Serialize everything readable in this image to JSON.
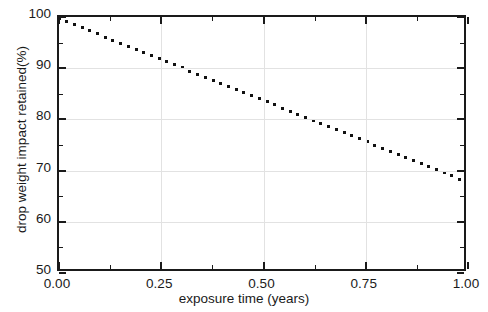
{
  "figure": {
    "title_fragment": "",
    "background_color": "#ffffff",
    "axis_color": "#1a1a1a",
    "grid_color": "#e2e2e2",
    "series_color": "#111111"
  },
  "axes": {
    "x": {
      "label": "exposure time (years)",
      "min": 0.0,
      "max": 1.0,
      "major_ticks": [
        0.0,
        0.25,
        0.5,
        0.75,
        1.0
      ],
      "major_tick_labels": [
        "0.00",
        "0.25",
        "0.50",
        "0.75",
        "1.00"
      ],
      "minor_ticks": [
        0.125,
        0.375,
        0.625,
        0.875
      ]
    },
    "y": {
      "label": "drop weight impact retained(%)",
      "min": 50,
      "max": 100,
      "major_ticks": [
        50,
        60,
        70,
        80,
        90,
        100
      ],
      "major_tick_labels": [
        "50",
        "60",
        "70",
        "80",
        "90",
        "100"
      ],
      "minor_ticks": [
        55,
        65,
        75,
        85,
        95
      ]
    }
  },
  "chart_data": {
    "type": "line",
    "title": "",
    "xlabel": "exposure time (years)",
    "ylabel": "drop weight impact retained(%)",
    "xlim": [
      0.0,
      1.0
    ],
    "ylim": [
      50,
      100
    ],
    "grid": true,
    "legend": null,
    "linestyle": "dotted",
    "series": [
      {
        "name": "drop weight impact retained",
        "color": "#111111",
        "x": [
          0.0,
          0.05,
          0.1,
          0.15,
          0.2,
          0.25,
          0.3,
          0.35,
          0.4,
          0.45,
          0.5,
          0.55,
          0.6,
          0.65,
          0.7,
          0.75,
          0.8,
          0.85,
          0.9,
          0.95,
          1.0
        ],
        "y": [
          99.7,
          98.1,
          96.5,
          94.9,
          93.3,
          91.7,
          90.1,
          88.5,
          86.9,
          85.3,
          83.7,
          82.1,
          80.5,
          78.9,
          77.3,
          75.7,
          74.1,
          72.5,
          70.9,
          69.3,
          67.7
        ]
      }
    ],
    "annotations": []
  }
}
